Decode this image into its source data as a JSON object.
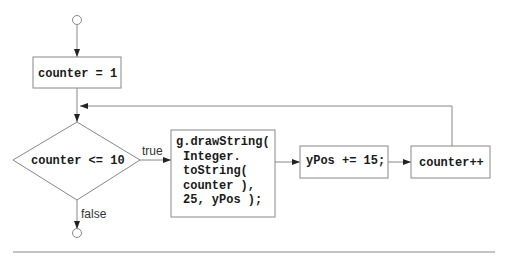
{
  "diagram": {
    "type": "flowchart",
    "init_box": {
      "label": "counter = 1"
    },
    "decision": {
      "label": "counter <= 10",
      "true_label": "true",
      "false_label": "false"
    },
    "body_box": {
      "lines": [
        "g.drawString(",
        "Integer.",
        "toString(",
        "counter ),",
        "25, yPos );"
      ]
    },
    "ypos_box": {
      "label": "yPos += 15;"
    },
    "increment_box": {
      "label": "counter++"
    },
    "line_color": "#808080",
    "text_color": "#1a1a1a"
  }
}
